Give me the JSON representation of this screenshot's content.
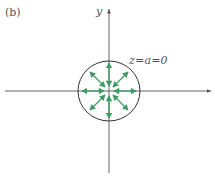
{
  "panel_label": "(b)",
  "axes": {
    "y_label": "y",
    "x_label": ""
  },
  "annotation": "z=a=0",
  "colors": {
    "axis": "#555555",
    "circle": "#333333",
    "arrows": "#3d9c62"
  },
  "figure": {
    "center": [
      109,
      91
    ],
    "circle_radius": 31,
    "arrow_count": 8,
    "arrow_style": "double-headed, radiating outward from origin"
  }
}
